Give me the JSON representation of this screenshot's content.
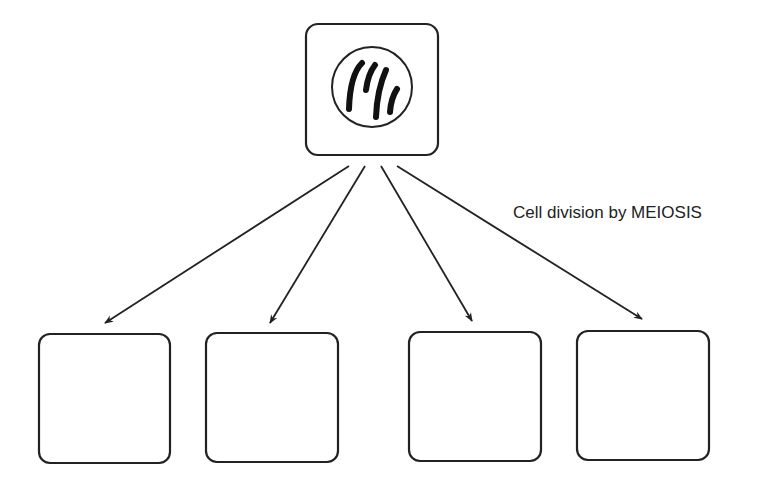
{
  "diagram": {
    "type": "flow",
    "title": "",
    "annotation": "Cell division by MEIOSIS",
    "parent_cell": {
      "shape": "rounded-square",
      "contents": "nucleus with chromosomes",
      "chromosome_count": 4
    },
    "daughter_cells": [
      {
        "id": 1,
        "contents": ""
      },
      {
        "id": 2,
        "contents": ""
      },
      {
        "id": 3,
        "contents": ""
      },
      {
        "id": 4,
        "contents": ""
      }
    ],
    "arrow_count": 4,
    "colors": {
      "stroke": "#222222",
      "background": "#ffffff"
    }
  }
}
